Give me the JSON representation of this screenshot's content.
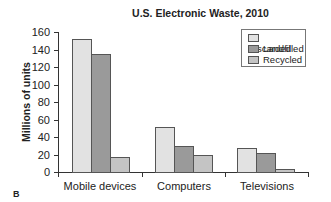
{
  "chart_data": {
    "type": "bar",
    "title": "U.S. Electronic Waste, 2010",
    "xlabel": "",
    "ylabel": "Millions of units",
    "ylim": [
      0,
      160
    ],
    "yticks": [
      0,
      20,
      40,
      60,
      80,
      100,
      120,
      140,
      160
    ],
    "categories": [
      "Mobile devices",
      "Computers",
      "Televisions"
    ],
    "series": [
      {
        "name": "Discarded",
        "color": "#e2e2e2",
        "values": [
          152,
          51,
          27
        ]
      },
      {
        "name": "Landfilled",
        "color": "#9a9a9a",
        "values": [
          135,
          30,
          22
        ]
      },
      {
        "name": "Recycled",
        "color": "#c4c4c4",
        "values": [
          17,
          19,
          4
        ]
      }
    ],
    "legend_position": "upper right",
    "grid": false
  },
  "labels": {
    "title": "U.S. Electronic Waste, 2010",
    "ylabel": "Millions of units",
    "yticks": [
      "0",
      "20",
      "40",
      "60",
      "80",
      "100",
      "120",
      "140",
      "160"
    ],
    "categories": [
      "Mobile devices",
      "Computers",
      "Televisions"
    ],
    "legend": [
      "Discarded",
      "Landfilled",
      "Recycled"
    ],
    "panel": "B"
  }
}
